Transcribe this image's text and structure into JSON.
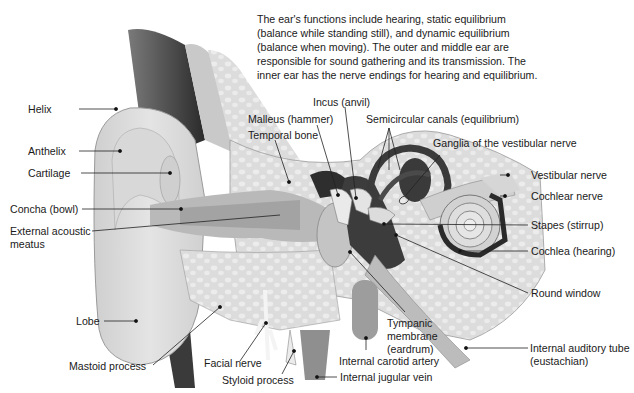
{
  "description": {
    "lines": [
      "The ear's functions include hearing, static equilibrium",
      "(balance while standing still), and dynamic equilibrium",
      "(balance when moving). The outer and middle ear are",
      "responsible for sound gathering and its transmission. The",
      "inner ear has the nerve endings for hearing and equilibrium."
    ]
  },
  "labels": {
    "helix": "Helix",
    "anthelix": "Anthelix",
    "cartilage": "Cartilage",
    "concha": "Concha (bowl)",
    "external_acoustic_1": "External acoustic",
    "external_acoustic_2": "meatus",
    "lobe": "Lobe",
    "mastoid": "Mastoid process",
    "facial_nerve": "Facial nerve",
    "styloid": "Styloid process",
    "internal_jugular": "Internal jugular vein",
    "internal_carotid": "Internal carotid artery",
    "tympanic_1": "Tympanic",
    "tympanic_2": "membrane",
    "tympanic_3": "(eardrum)",
    "internal_auditory_1": "Internal auditory tube",
    "internal_auditory_2": "(eustachian)",
    "round_window": "Round window",
    "cochlea": "Cochlea (hearing)",
    "stapes": "Stapes (stirrup)",
    "cochlear_nerve": "Cochlear nerve",
    "vestibular_nerve": "Vestibular nerve",
    "ganglia": "Ganglia of the vestibular nerve",
    "semicircular": "Semicircular canals (equilibrium)",
    "incus": "Incus (anvil)",
    "malleus": "Malleus (hammer)",
    "temporal_bone": "Temporal bone"
  }
}
